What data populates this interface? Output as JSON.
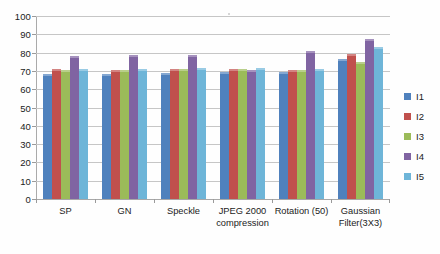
{
  "chart_data": {
    "type": "bar",
    "title": "",
    "xlabel": "",
    "ylabel": "",
    "ylim": [
      0,
      100
    ],
    "ytick_step": 10,
    "grid": true,
    "legend_position": "right",
    "categories": [
      "SP",
      "GN",
      "Speckle",
      "JPEG 2000\ncompression",
      "Rotation (50)",
      "Gaussian\nFilter(3X3)"
    ],
    "yticks": [
      "0",
      "10",
      "20",
      "30",
      "40",
      "50",
      "60",
      "70",
      "80",
      "90",
      "100"
    ],
    "series": [
      {
        "name": "I1",
        "color": "#4f81bd",
        "values": [
          68.2,
          68.3,
          68.8,
          69.3,
          69.2,
          76.5
        ]
      },
      {
        "name": "I2",
        "color": "#c0504d",
        "values": [
          71.3,
          70.7,
          70.8,
          70.8,
          70.6,
          79.4
        ]
      },
      {
        "name": "I3",
        "color": "#9bbb59",
        "values": [
          70.5,
          70.4,
          70.8,
          70.8,
          70.5,
          74.6
        ]
      },
      {
        "name": "I4",
        "color": "#8064a2",
        "values": [
          78.2,
          78.6,
          78.8,
          70.4,
          81.0,
          87.2
        ]
      },
      {
        "name": "I5",
        "color": "#6eb5d8",
        "values": [
          71.3,
          71.3,
          71.8,
          71.5,
          71.1,
          83.0
        ]
      }
    ]
  },
  "legend": {
    "items": [
      {
        "label": "I1"
      },
      {
        "label": "I2"
      },
      {
        "label": "I3"
      },
      {
        "label": "I4"
      },
      {
        "label": "I5"
      }
    ]
  }
}
